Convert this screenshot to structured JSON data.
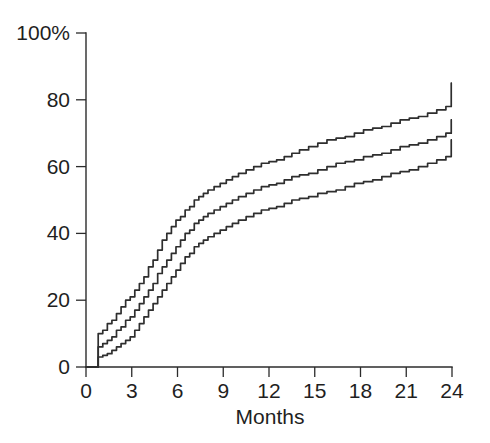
{
  "chart_data": {
    "type": "line",
    "title": "",
    "subtitle": "",
    "xlabel": "Months",
    "ylabel": "",
    "xlim": [
      0,
      24
    ],
    "ylim": [
      0,
      100
    ],
    "grid": false,
    "legend_position": "none",
    "step_style": "post",
    "x_ticks": [
      0,
      3,
      6,
      9,
      12,
      15,
      18,
      21,
      24
    ],
    "x_tick_labels": [
      "0",
      "3",
      "6",
      "9",
      "12",
      "15",
      "18",
      "21",
      "24"
    ],
    "y_ticks": [
      0,
      20,
      40,
      60,
      80,
      100
    ],
    "y_tick_labels": [
      "0",
      "20",
      "40",
      "60",
      "80",
      "100%"
    ],
    "annotations": [],
    "series": [
      {
        "name": "Upper 95% confidence limit",
        "color": "#2e2e2e",
        "x": [
          0.0,
          0.8,
          0.8,
          1.1,
          1.4,
          1.7,
          2.0,
          2.3,
          2.6,
          2.9,
          3.2,
          3.5,
          3.8,
          4.1,
          4.4,
          4.7,
          5.0,
          5.3,
          5.6,
          5.9,
          6.2,
          6.5,
          6.8,
          7.1,
          7.4,
          7.7,
          8.0,
          8.4,
          8.8,
          9.2,
          9.6,
          10.0,
          10.5,
          11.0,
          11.5,
          12.0,
          12.5,
          13.0,
          13.5,
          14.0,
          14.6,
          15.2,
          15.8,
          16.4,
          17.0,
          17.6,
          18.2,
          18.8,
          19.4,
          20.0,
          20.6,
          21.2,
          21.8,
          22.4,
          23.0,
          23.6,
          23.95,
          23.95,
          24.0
        ],
        "y": [
          0,
          0,
          10,
          11,
          13,
          14,
          16,
          18,
          20,
          21,
          23,
          25,
          27,
          30,
          32,
          35,
          38,
          40,
          42,
          44,
          45,
          47,
          48,
          50,
          51,
          52,
          53,
          54,
          55,
          56,
          57,
          58,
          59,
          60,
          61,
          61.5,
          62,
          63,
          64,
          65,
          66,
          67,
          68,
          68.5,
          69,
          70,
          71,
          71.5,
          72,
          73,
          74,
          74.5,
          75,
          76,
          77,
          78,
          78,
          85,
          85
        ]
      },
      {
        "name": "Cumulative incidence estimate",
        "color": "#2e2e2e",
        "x": [
          0.0,
          0.8,
          0.8,
          1.1,
          1.4,
          1.7,
          2.0,
          2.3,
          2.6,
          2.9,
          3.2,
          3.5,
          3.8,
          4.1,
          4.4,
          4.7,
          5.0,
          5.3,
          5.6,
          5.9,
          6.2,
          6.5,
          6.8,
          7.1,
          7.4,
          7.7,
          8.0,
          8.4,
          8.8,
          9.2,
          9.6,
          10.0,
          10.5,
          11.0,
          11.5,
          12.0,
          12.5,
          13.0,
          13.5,
          14.0,
          14.6,
          15.2,
          15.8,
          16.4,
          17.0,
          17.6,
          18.2,
          18.8,
          19.4,
          20.0,
          20.6,
          21.2,
          21.8,
          22.4,
          23.0,
          23.6,
          23.95,
          23.95,
          24.0
        ],
        "y": [
          0,
          0,
          6,
          7,
          8,
          9,
          11,
          12,
          14,
          15,
          17,
          19,
          21,
          23,
          25,
          28,
          30,
          32,
          34,
          36,
          38,
          40,
          41,
          43,
          44,
          45,
          46,
          47,
          48,
          49,
          50,
          51,
          52,
          53,
          54,
          54.5,
          55,
          56,
          57,
          57.5,
          58,
          59,
          60,
          61,
          61.5,
          62,
          63,
          63.5,
          64,
          65,
          66,
          66.5,
          67,
          68,
          69,
          70,
          70.5,
          74,
          74
        ]
      },
      {
        "name": "Lower 95% confidence limit",
        "color": "#2e2e2e",
        "x": [
          0.0,
          0.8,
          0.8,
          1.1,
          1.4,
          1.7,
          2.0,
          2.3,
          2.6,
          2.9,
          3.2,
          3.5,
          3.8,
          4.1,
          4.4,
          4.7,
          5.0,
          5.3,
          5.6,
          5.9,
          6.2,
          6.5,
          6.8,
          7.1,
          7.4,
          7.7,
          8.0,
          8.4,
          8.8,
          9.2,
          9.6,
          10.0,
          10.5,
          11.0,
          11.5,
          12.0,
          12.5,
          13.0,
          13.5,
          14.0,
          14.6,
          15.2,
          15.8,
          16.4,
          17.0,
          17.6,
          18.2,
          18.8,
          19.4,
          20.0,
          20.6,
          21.2,
          21.8,
          22.4,
          23.0,
          23.6,
          23.95,
          23.95,
          24.0
        ],
        "y": [
          0,
          0,
          3,
          3.5,
          4,
          5,
          6,
          7,
          8,
          9,
          11,
          13,
          15,
          17,
          19,
          21,
          23,
          25,
          27,
          29,
          31,
          33,
          34,
          36,
          37,
          38,
          39,
          40,
          41,
          42,
          43,
          44,
          45,
          46,
          47,
          47.5,
          48,
          49,
          50,
          50.5,
          51,
          52,
          52.5,
          53,
          54,
          55,
          55.5,
          56,
          57,
          58,
          58.5,
          59,
          60,
          61,
          62,
          63,
          63,
          68,
          68
        ]
      }
    ]
  }
}
